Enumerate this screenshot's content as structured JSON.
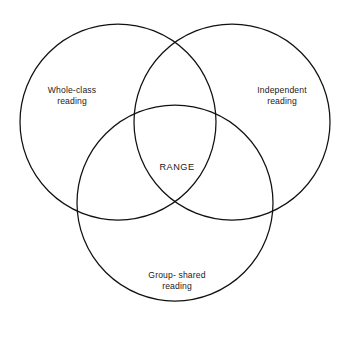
{
  "figure": {
    "type": "venn-diagram-3-set",
    "background_color": "#ffffff",
    "stroke_color": "#111111",
    "text_color": "#1a1a1a"
  },
  "sets": [
    {
      "id": "whole-class",
      "label": "Whole-class\nreading",
      "position": "top-left",
      "center_x": 118,
      "center_y": 122,
      "radius": 98
    },
    {
      "id": "independent",
      "label": "Independent\nreading",
      "position": "top-right",
      "center_x": 232,
      "center_y": 122,
      "radius": 98
    },
    {
      "id": "group-shared",
      "label": "Group- shared\nreading",
      "position": "bottom-center",
      "center_x": 175,
      "center_y": 203,
      "radius": 98
    }
  ],
  "intersection": {
    "id": "range",
    "label": "RANGE",
    "description": "central region common to all three sets"
  }
}
